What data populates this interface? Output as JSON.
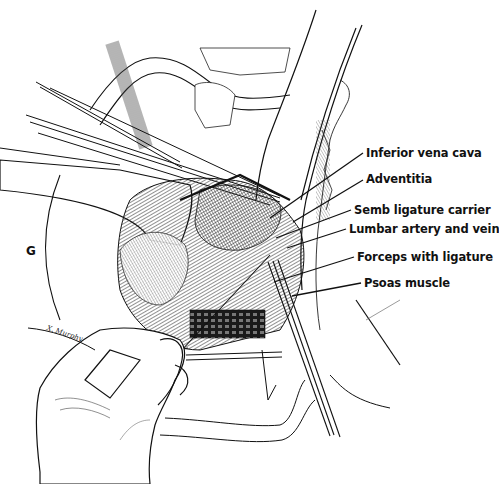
{
  "figure": {
    "panel_letter": "G",
    "signature": "X. Murphy",
    "labels": [
      {
        "text": "Inferior vena cava",
        "x": 366,
        "y": 146,
        "line_from": [
          363,
          153
        ],
        "line_to": [
          270,
          218
        ]
      },
      {
        "text": "Adventitia",
        "x": 366,
        "y": 172,
        "line_from": [
          363,
          180
        ],
        "line_to": [
          293,
          222
        ]
      },
      {
        "text": "Semb ligature carrier",
        "x": 354,
        "y": 203,
        "line_from": [
          351,
          210
        ],
        "line_to": [
          276,
          238
        ]
      },
      {
        "text": "Lumbar artery and vein",
        "x": 349,
        "y": 222,
        "line_from": [
          346,
          229
        ],
        "line_to": [
          287,
          248
        ]
      },
      {
        "text": "Forceps with ligature",
        "x": 357,
        "y": 250,
        "line_from": [
          354,
          257
        ],
        "line_to": [
          274,
          282
        ]
      },
      {
        "text": "Psoas muscle",
        "x": 364,
        "y": 276,
        "line_from": [
          361,
          283
        ],
        "line_to": [
          292,
          296
        ]
      }
    ]
  },
  "colors": {
    "ink": "#111111",
    "paper": "#ffffff",
    "shade": "#555555"
  }
}
